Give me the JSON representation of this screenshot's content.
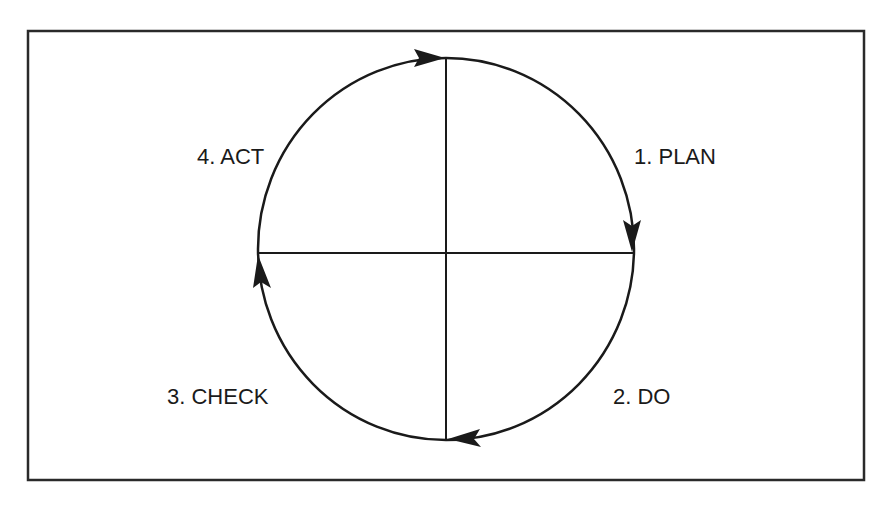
{
  "diagram": {
    "type": "cycle",
    "stroke_color": "#1a1a1a",
    "background": "#ffffff",
    "steps": [
      {
        "label": "1. PLAN",
        "quadrant": "top-right"
      },
      {
        "label": "2. DO",
        "quadrant": "bottom-right"
      },
      {
        "label": "3. CHECK",
        "quadrant": "bottom-left"
      },
      {
        "label": "4. ACT",
        "quadrant": "top-left"
      }
    ],
    "direction": "clockwise"
  }
}
